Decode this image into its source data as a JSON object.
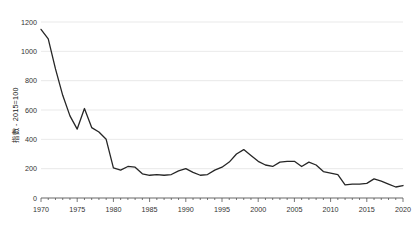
{
  "chart_data": {
    "type": "line",
    "title": "",
    "xlabel": "",
    "ylabel": "指數 - 2015=100",
    "xlim": [
      1970,
      2020
    ],
    "ylim": [
      0,
      1200
    ],
    "ytick_values": [
      0,
      200,
      400,
      600,
      800,
      1000,
      1200
    ],
    "ytick_labels": [
      "0",
      "200",
      "400",
      "600",
      "800",
      "1000",
      "1200"
    ],
    "xtick_values": [
      1970,
      1975,
      1980,
      1985,
      1990,
      1995,
      2000,
      2005,
      2010,
      2015,
      2020
    ],
    "xtick_labels": [
      "1970",
      "1975",
      "1980",
      "1985",
      "1990",
      "1995",
      "2000",
      "2005",
      "2010",
      "2015",
      "2020"
    ],
    "x_minor_tick_step": 1,
    "grid": "horizontal",
    "legend": "none",
    "line_color": "#262626",
    "grid_color": "#e3e3e3",
    "axis_color": "#555555",
    "background": "#ffffff",
    "x": [
      1970,
      1971,
      1972,
      1973,
      1974,
      1975,
      1976,
      1977,
      1978,
      1979,
      1980,
      1981,
      1982,
      1983,
      1984,
      1985,
      1986,
      1987,
      1988,
      1989,
      1990,
      1991,
      1992,
      1993,
      1994,
      1995,
      1996,
      1997,
      1998,
      1999,
      2000,
      2001,
      2002,
      2003,
      2004,
      2005,
      2006,
      2007,
      2008,
      2009,
      2010,
      2011,
      2012,
      2013,
      2014,
      2015,
      2016,
      2017,
      2018,
      2019,
      2020
    ],
    "values": [
      1150,
      1085,
      880,
      700,
      560,
      470,
      610,
      480,
      450,
      400,
      205,
      190,
      215,
      210,
      165,
      155,
      160,
      155,
      160,
      185,
      200,
      175,
      155,
      160,
      190,
      210,
      245,
      300,
      330,
      290,
      250,
      225,
      215,
      245,
      250,
      250,
      215,
      245,
      225,
      180,
      170,
      160,
      90,
      95,
      95,
      100,
      130,
      115,
      95,
      75,
      85
    ]
  }
}
